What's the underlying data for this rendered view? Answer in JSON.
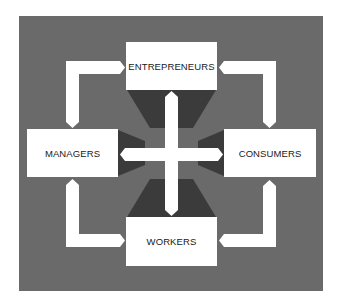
{
  "diagram": {
    "colors": {
      "background": "#6a6a6a",
      "shadow": "#3b3b3b",
      "box": "#ffffff",
      "arrow": "#ffffff",
      "text": "#1a1a1a"
    },
    "nodes": {
      "top": {
        "label": "ENTREPRENEURS"
      },
      "left": {
        "label": "MANAGERS"
      },
      "right": {
        "label": "CONSUMERS"
      },
      "bottom": {
        "label": "WORKERS"
      }
    },
    "connections": [
      {
        "from": "ENTREPRENEURS",
        "to": "MANAGERS",
        "type": "two-way-elbow"
      },
      {
        "from": "ENTREPRENEURS",
        "to": "CONSUMERS",
        "type": "two-way-elbow"
      },
      {
        "from": "MANAGERS",
        "to": "WORKERS",
        "type": "two-way-elbow"
      },
      {
        "from": "CONSUMERS",
        "to": "WORKERS",
        "type": "two-way-elbow"
      },
      {
        "from": "ENTREPRENEURS",
        "to": "WORKERS",
        "type": "two-way-straight"
      },
      {
        "from": "MANAGERS",
        "to": "CONSUMERS",
        "type": "two-way-straight"
      }
    ]
  }
}
